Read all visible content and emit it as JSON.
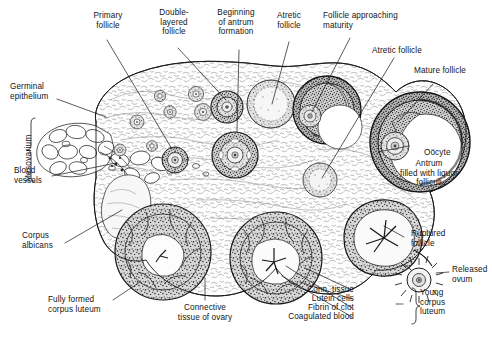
{
  "figure": {
    "background_color": "#ffffff",
    "ink_color": "#141414"
  },
  "labels": {
    "primary_follicle": "Primary\nfollicle",
    "double_layered_follicle": "Double-\nlayered\nfollicle",
    "beginning_antrum": "Beginning\nof antrum\nformation",
    "atretic_follicle_top": "Atretic\nfollicle",
    "follicle_approaching_maturity": "Follicle approaching\nmaturity",
    "atretic_follicle_right": "Atretic follicle",
    "mature_follicle": "Mature follicle",
    "germinal_epithelium": "Germinal\nepithelium",
    "mesovarium": "Mesovarium",
    "blood_vessels": "Blood\nvessels",
    "corpus_albicans": "Corpus\nalbicans",
    "fully_formed_corpus_luteum": "Fully formed\ncorpus luteum",
    "connective_tissue_of_ovary": "Connective\ntissue of ovary",
    "oocyte": "Oöcyte",
    "antrum": "Antrum\nfilled with liquor\nfolliculi",
    "ruptured_follicle": "Ruptured\nfollicle",
    "released_ovum": "Released\novum",
    "young_corpus_luteum": "Young\ncorpus\nluteum",
    "conn_tissue": "Conn. tissue",
    "lutein_cells": "Lutein cells",
    "fibrin_of_clot": "Fibrin of clot",
    "coagulated_blood": "Coagulated blood"
  }
}
